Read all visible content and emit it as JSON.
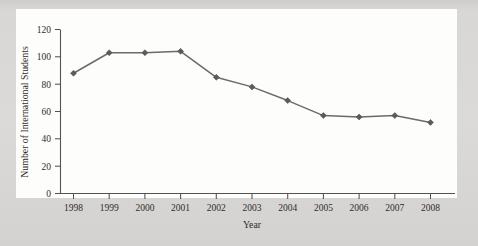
{
  "chart_data": {
    "type": "line",
    "title": "",
    "xlabel": "Year",
    "ylabel": "Number of International Students",
    "categories": [
      "1998",
      "1999",
      "2000",
      "2001",
      "2002",
      "2003",
      "2004",
      "2005",
      "2006",
      "2007",
      "2008"
    ],
    "x": [
      1998,
      1999,
      2000,
      2001,
      2002,
      2003,
      2004,
      2005,
      2006,
      2007,
      2008
    ],
    "values": [
      88,
      103,
      103,
      104,
      85,
      78,
      68,
      57,
      56,
      57,
      52
    ],
    "series": [
      {
        "name": "Number of International Students",
        "values": [
          88,
          103,
          103,
          104,
          85,
          78,
          68,
          57,
          56,
          57,
          52
        ]
      }
    ],
    "ylim": [
      0,
      120
    ],
    "yticks": [
      0,
      20,
      40,
      60,
      80,
      100,
      120
    ],
    "ytick_labels": [
      "0",
      "20",
      "40",
      "60",
      "80",
      "100",
      "120"
    ],
    "xtick_labels": [
      "1998",
      "1999",
      "2000",
      "2001",
      "2002",
      "2003",
      "2004",
      "2005",
      "2006",
      "2007",
      "2008"
    ],
    "grid": false,
    "legend": "none",
    "marker": "diamond",
    "line_color": "#6d6b6a",
    "marker_color": "#5d5b5a",
    "axis_color": "#545251",
    "plot_background": "#fdfdfc",
    "page_background": "#d8d6d4"
  },
  "axes": {
    "y_title": "Number of International Students",
    "x_title": "Year"
  }
}
